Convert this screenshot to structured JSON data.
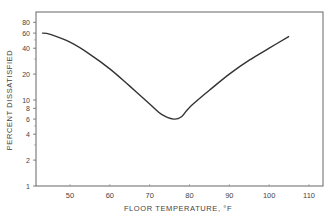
{
  "chart_data": {
    "type": "line",
    "title": "",
    "xlabel": "FLOOR TEMPERATURE, °F",
    "ylabel": "PERCENT DISSATISFIED",
    "yscale": "log",
    "xlim": [
      42,
      113
    ],
    "ylim": [
      1,
      100
    ],
    "x_ticks": [
      50,
      60,
      70,
      80,
      90,
      100,
      110
    ],
    "y_ticks": [
      1,
      2,
      4,
      6,
      8,
      10,
      20,
      40,
      60,
      80
    ],
    "y_minor_ticks": [
      3,
      5,
      30,
      50
    ],
    "grid": false,
    "legend": null,
    "series": [
      {
        "name": "Percent dissatisfied",
        "x": [
          43,
          45,
          50,
          55,
          60,
          65,
          70,
          73,
          76,
          78,
          80,
          85,
          90,
          95,
          100,
          105
        ],
        "y": [
          60,
          58,
          47,
          34,
          23,
          14.5,
          9,
          6.8,
          6.0,
          6.4,
          8.2,
          13,
          20,
          29,
          40,
          55
        ]
      }
    ],
    "annotations": []
  }
}
